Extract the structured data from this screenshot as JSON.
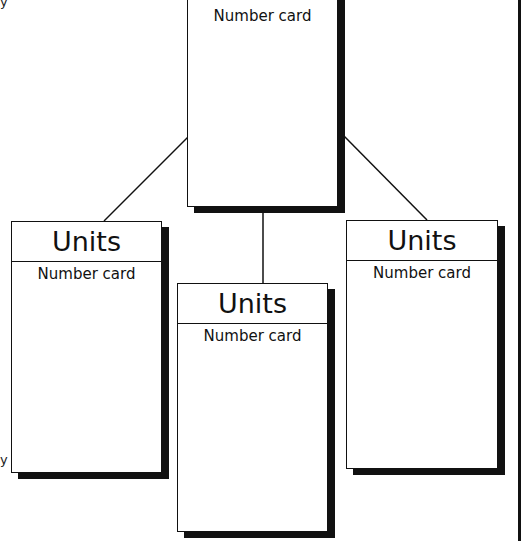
{
  "diagram": {
    "root_card": {
      "label": "Number card"
    },
    "child_cards": [
      {
        "title": "Units",
        "label": "Number card"
      },
      {
        "title": "Units",
        "label": "Number card"
      },
      {
        "title": "Units",
        "label": "Number card"
      }
    ],
    "edge_glyphs": {
      "top_left": "y",
      "bottom_left": "y"
    },
    "colors": {
      "line": "#111111",
      "background": "#ffffff"
    }
  }
}
